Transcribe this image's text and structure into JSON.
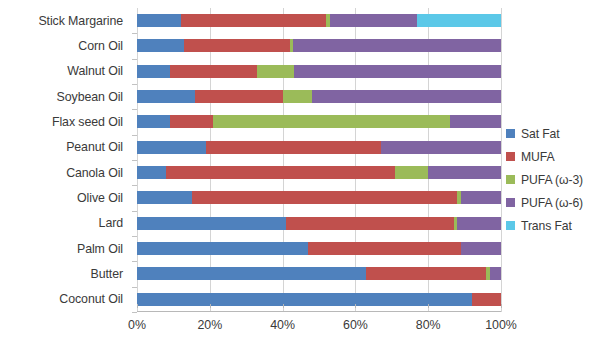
{
  "chart_data": {
    "type": "bar",
    "orientation": "horizontal",
    "stacked": true,
    "stack_mode": "percent",
    "title": "",
    "subtitle": "",
    "xlabel": "",
    "ylabel": "",
    "xlim": [
      0,
      100
    ],
    "xtick_labels": [
      "0%",
      "20%",
      "40%",
      "60%",
      "80%",
      "100%"
    ],
    "xticks": [
      0,
      20,
      40,
      60,
      80,
      100
    ],
    "grid": true,
    "legend_position": "right",
    "categories": [
      "Stick Margarine",
      "Corn Oil",
      "Walnut Oil",
      "Soybean Oil",
      "Flax seed Oil",
      "Peanut Oil",
      "Canola Oil",
      "Olive Oil",
      "Lard",
      "Palm Oil",
      "Butter",
      "Coconut Oil"
    ],
    "series": [
      {
        "name": "Sat Fat",
        "color": "#4F81BD",
        "values": [
          12,
          13,
          9,
          16,
          9,
          19,
          8,
          15,
          41,
          47,
          63,
          92
        ]
      },
      {
        "name": "MUFA",
        "color": "#C0504D",
        "values": [
          40,
          29,
          24,
          24,
          12,
          48,
          63,
          73,
          46,
          42,
          33,
          8
        ]
      },
      {
        "name": "PUFA (ω-3)",
        "color": "#9BBB59",
        "values": [
          1,
          1,
          10,
          8,
          65,
          0,
          9,
          1,
          1,
          0,
          1,
          0
        ]
      },
      {
        "name": "PUFA (ω-6)",
        "color": "#8064A2",
        "values": [
          24,
          57,
          57,
          52,
          14,
          33,
          20,
          11,
          12,
          11,
          3,
          0
        ]
      },
      {
        "name": "Trans Fat",
        "color": "#5BC8E8",
        "values": [
          23,
          0,
          0,
          0,
          0,
          0,
          0,
          0,
          0,
          0,
          0,
          0
        ]
      }
    ]
  }
}
